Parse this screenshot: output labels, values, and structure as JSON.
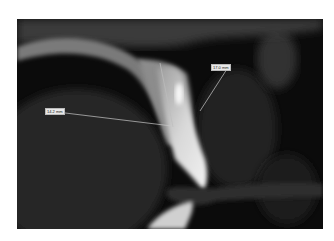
{
  "image": {
    "type": "dental-cbct-sagittal-slice",
    "description": "Sagittal CT slice of upper incisor with measurement annotations"
  },
  "annotations": [
    {
      "id": "measure-1",
      "label": "17.0 mm",
      "box": {
        "x": 211,
        "y": 64
      }
    },
    {
      "id": "measure-2",
      "label": "14.2 mm",
      "box": {
        "x": 45,
        "y": 108
      }
    }
  ],
  "colors": {
    "background": "#ffffff",
    "scan_background": "#0a0a0a",
    "bone": "#8a8a8a",
    "tooth": "#e6e6e6",
    "label_bg": "#e8e8e8",
    "measure_line": "#c8c8c8"
  }
}
